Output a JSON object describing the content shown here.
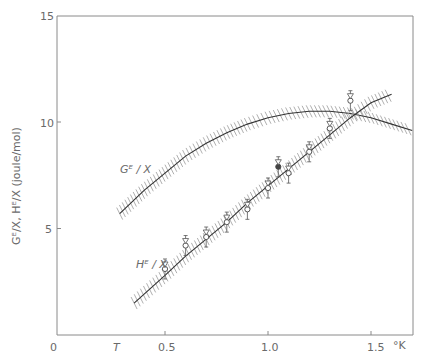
{
  "chart_data": {
    "type": "line",
    "title": "",
    "xlabel": "T",
    "xunit": "°K",
    "ylabel": "G^E/X, H^E/X (joule/mol)",
    "xlim": [
      0,
      1.7
    ],
    "ylim": [
      0,
      15
    ],
    "x_ticks": [
      "0",
      "0.5",
      "1.0",
      "1.5"
    ],
    "y_ticks": [
      "0",
      "5",
      "10",
      "15"
    ],
    "grid": false,
    "series": [
      {
        "name": "G^E/X",
        "style": "solid curve with hatched uncertainty band, dashed beyond 1.5",
        "x": [
          0.28,
          0.4,
          0.5,
          0.6,
          0.7,
          0.8,
          0.9,
          1.0,
          1.1,
          1.2,
          1.3,
          1.4,
          1.5,
          1.6,
          1.7
        ],
        "y": [
          5.7,
          6.8,
          7.6,
          8.4,
          9.0,
          9.5,
          9.9,
          10.2,
          10.4,
          10.5,
          10.5,
          10.4,
          10.2,
          9.9,
          9.6
        ]
      },
      {
        "name": "H^E/X",
        "style": "straight line with hatched band and data points with error bars",
        "x": [
          0.35,
          0.5,
          0.6,
          0.7,
          0.8,
          0.9,
          1.0,
          1.1,
          1.2,
          1.3,
          1.4,
          1.5,
          1.6
        ],
        "y": [
          1.5,
          2.8,
          3.7,
          4.5,
          5.3,
          6.2,
          7.0,
          7.8,
          8.6,
          9.4,
          10.2,
          10.9,
          11.3
        ]
      }
    ],
    "points": [
      {
        "x": 0.5,
        "y": 3.1,
        "series": "H^E/X"
      },
      {
        "x": 0.6,
        "y": 4.2,
        "series": "H^E/X"
      },
      {
        "x": 0.7,
        "y": 4.6,
        "series": "H^E/X"
      },
      {
        "x": 0.8,
        "y": 5.3,
        "series": "H^E/X"
      },
      {
        "x": 0.9,
        "y": 5.9,
        "series": "H^E/X"
      },
      {
        "x": 1.0,
        "y": 6.9,
        "series": "H^E/X"
      },
      {
        "x": 1.05,
        "y": 7.9,
        "series": "H^E/X",
        "filled": true
      },
      {
        "x": 1.1,
        "y": 7.6,
        "series": "H^E/X"
      },
      {
        "x": 1.2,
        "y": 8.6,
        "series": "H^E/X"
      },
      {
        "x": 1.3,
        "y": 9.7,
        "series": "H^E/X"
      },
      {
        "x": 1.4,
        "y": 11.0,
        "series": "H^E/X"
      }
    ],
    "annotations": [
      "G^E / X",
      "H^E / X"
    ]
  },
  "labels": {
    "y_axis": "Gᴱ/X, Hᴱ/X  (joule/mol)",
    "x_unit": "°K",
    "x_var": "T",
    "ticks_x": [
      "0",
      "0.5",
      "1.0",
      "1.5"
    ],
    "ticks_y": [
      "15",
      "10",
      "5"
    ],
    "curve_g": "Gᴱ / X",
    "curve_h": "Hᴱ / X"
  }
}
